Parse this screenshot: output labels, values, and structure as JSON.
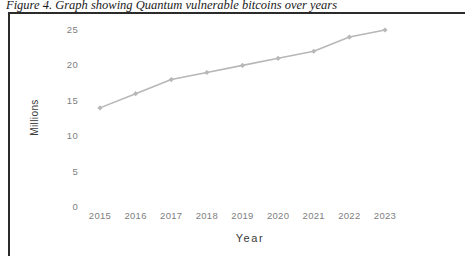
{
  "figure": {
    "caption": "Figure 4. Graph showing Quantum vulnerable bitcoins over years",
    "border_color": "#2b2b2b"
  },
  "chart_data": {
    "type": "line",
    "title": "",
    "subtitle": "",
    "xlabel": "Year",
    "ylabel": "Millions",
    "categories": [
      "2015",
      "2016",
      "2017",
      "2018",
      "2019",
      "2020",
      "2021",
      "2022",
      "2023"
    ],
    "x": [
      2015,
      2016,
      2017,
      2018,
      2019,
      2020,
      2021,
      2022,
      2023
    ],
    "values": [
      14,
      16,
      18,
      19,
      20,
      21,
      22,
      24,
      25
    ],
    "series": [
      {
        "name": "Quantum vulnerable bitcoins",
        "values": [
          14,
          16,
          18,
          19,
          20,
          21,
          22,
          24,
          25
        ],
        "color": "#b7b7b7",
        "marker": "diamond"
      }
    ],
    "ylim": [
      0,
      25
    ],
    "yticks": [
      0,
      5,
      10,
      15,
      20,
      25
    ],
    "ytick_labels": [
      "0",
      "5",
      "10",
      "15",
      "20",
      "25"
    ],
    "xlim": [
      2015,
      2023
    ],
    "grid": false,
    "legend": false,
    "legend_position": "none",
    "axis_line": false,
    "line_color": "#b7b7b7",
    "tick_label_color": "#808080",
    "axis_title_color": "#3a3a3a"
  }
}
